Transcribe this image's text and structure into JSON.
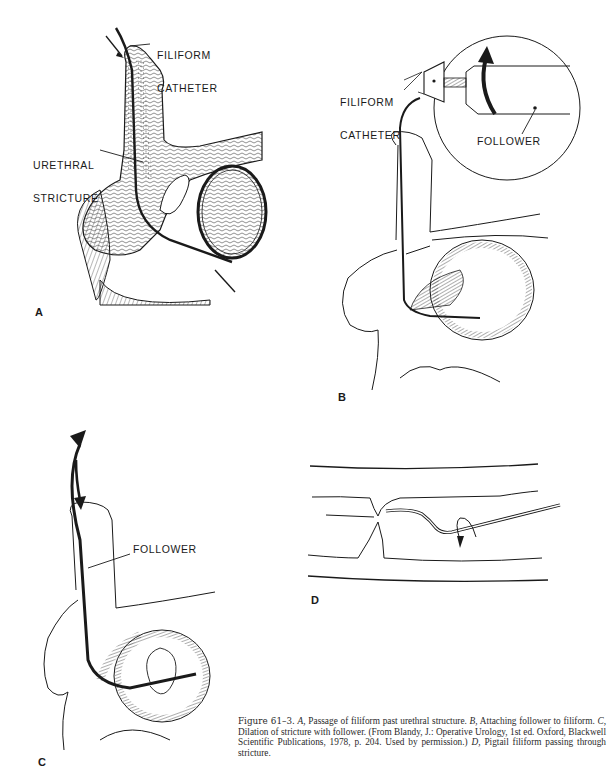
{
  "figure": {
    "number": "Figure 61–3.",
    "caption_segments": [
      {
        "type": "plain",
        "text": " "
      },
      {
        "type": "italic",
        "text": "A,"
      },
      {
        "type": "plain",
        "text": " Passage of filiform past urethral structure. "
      },
      {
        "type": "italic",
        "text": "B,"
      },
      {
        "type": "plain",
        "text": " Attaching follower to filiform. "
      },
      {
        "type": "italic",
        "text": "C,"
      },
      {
        "type": "plain",
        "text": " Dilation of stricture with follower. (From Blandy, J.: Operative Urology, 1st ed. Oxford, Blackwell Scientific Publications, 1978, p. 204. Used by permission.) "
      },
      {
        "type": "italic",
        "text": "D,"
      },
      {
        "type": "plain",
        "text": " Pigtail filiform passing through stricture."
      }
    ]
  },
  "panels": {
    "A": {
      "letter": "A",
      "labels": {
        "filiform_catheter_line1": "FILIFORM",
        "filiform_catheter_line2": "CATHETER",
        "urethral_stricture_line1": "URETHRAL",
        "urethral_stricture_line2": "STRICTURE"
      }
    },
    "B": {
      "letter": "B",
      "labels": {
        "filiform_catheter_line1": "FILIFORM",
        "filiform_catheter_line2": "CATHETER",
        "follower": "FOLLOWER"
      }
    },
    "C": {
      "letter": "C",
      "labels": {
        "follower": "FOLLOWER"
      }
    },
    "D": {
      "letter": "D",
      "labels": {}
    }
  },
  "colors": {
    "ink": "#1a1a1a",
    "background": "#ffffff"
  }
}
